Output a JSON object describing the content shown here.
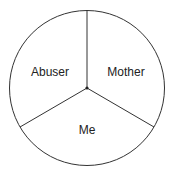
{
  "diagram": {
    "type": "pie-divided-circle",
    "segments": [
      {
        "label": "Abuser",
        "position": "upper-left"
      },
      {
        "label": "Mother",
        "position": "upper-right"
      },
      {
        "label": "Me",
        "position": "bottom"
      }
    ],
    "colors": {
      "stroke": "#333333",
      "fill": "#ffffff",
      "text": "#222222"
    }
  }
}
